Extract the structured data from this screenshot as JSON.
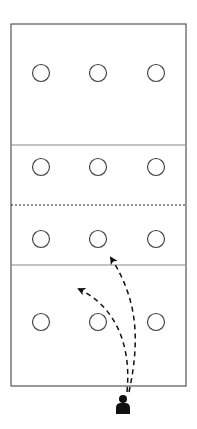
{
  "diagram": {
    "type": "volleyball-court-drill",
    "colors": {
      "background": "#ffffff",
      "court_line": "#555555",
      "divider_line": "#888888",
      "net_dashed": "#222222",
      "cone": "#444444",
      "arrow": "#111111",
      "player": "#111111"
    },
    "court": {
      "x": 11,
      "y": 24,
      "width": 175,
      "height": 362
    },
    "lines": [
      {
        "name": "attack-line-top",
        "y": 145,
        "style": "solid"
      },
      {
        "name": "net",
        "y": 205,
        "style": "dashed"
      },
      {
        "name": "attack-line-bottom",
        "y": 265,
        "style": "solid"
      }
    ],
    "cones": [
      {
        "cx": 41,
        "cy": 73
      },
      {
        "cx": 98,
        "cy": 73
      },
      {
        "cx": 156,
        "cy": 73
      },
      {
        "cx": 41,
        "cy": 167
      },
      {
        "cx": 98,
        "cy": 167
      },
      {
        "cx": 156,
        "cy": 167
      },
      {
        "cx": 41,
        "cy": 239
      },
      {
        "cx": 98,
        "cy": 239
      },
      {
        "cx": 156,
        "cy": 239
      },
      {
        "cx": 41,
        "cy": 322
      },
      {
        "cx": 98,
        "cy": 322
      },
      {
        "cx": 156,
        "cy": 322
      }
    ],
    "paths": [
      {
        "name": "path-to-middle-front",
        "from": [
          128,
          393
        ],
        "to": [
          110,
          257
        ]
      },
      {
        "name": "path-to-left-back",
        "from": [
          126,
          393
        ],
        "to": [
          78,
          288
        ]
      }
    ],
    "player": {
      "cx": 123,
      "cy": 404
    }
  }
}
